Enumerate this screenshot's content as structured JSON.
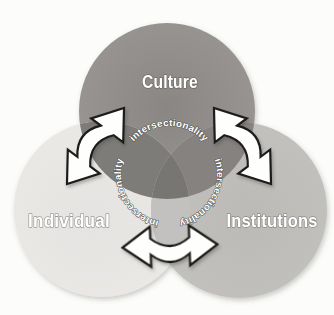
{
  "figure": {
    "type": "venn-diagram",
    "circles": [
      {
        "id": "culture",
        "label": "Culture"
      },
      {
        "id": "individual",
        "label": "Individual"
      },
      {
        "id": "institutions",
        "label": "Institutions"
      }
    ],
    "center_label": {
      "word": "intersectionality",
      "repeats": 3,
      "arrangement": "circular-around-center-overlap"
    },
    "connections": [
      {
        "from": "Culture",
        "to": "Individual",
        "style": "double-headed-arrow"
      },
      {
        "from": "Culture",
        "to": "Institutions",
        "style": "double-headed-arrow"
      },
      {
        "from": "Individual",
        "to": "Institutions",
        "style": "double-headed-arrow"
      }
    ]
  },
  "colors": {
    "background": "#fcfcfb",
    "culture_center": "#898683",
    "culture_edge": "#989592",
    "individual_center": "#e4e3e1",
    "individual_edge": "#eae9e6",
    "institutions_center": "#bbbab7",
    "institutions_edge": "#c2c1be",
    "overlap_culture_individual": "#7d7b78",
    "overlap_culture_institutions": "#858280",
    "overlap_individual_institutions": "#c2c1bf",
    "overlap_center": "#787673",
    "arrow_fill": "#fefefd",
    "arrow_outline": "#1d1c1a",
    "label_fill": "#ffffff"
  }
}
